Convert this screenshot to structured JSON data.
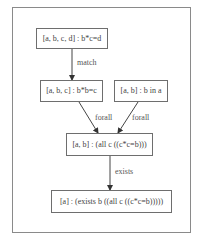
{
  "diagram": {
    "nodes": [
      {
        "id": "n1",
        "label": "[a, b, c, d] : b*c=d"
      },
      {
        "id": "n2",
        "label": "[a, b, c] : b*b=c"
      },
      {
        "id": "n3",
        "label": "[a, b] : b in a"
      },
      {
        "id": "n4",
        "label": "[a, b] : (all c ((c*c=b)))"
      },
      {
        "id": "n5",
        "label": "[a] : (exists b ((all c ((c*c=b)))))"
      }
    ],
    "edges": [
      {
        "from": "n1",
        "to": "n2",
        "label": "match"
      },
      {
        "from": "n2",
        "to": "n4",
        "label": "forall"
      },
      {
        "from": "n3",
        "to": "n4",
        "label": "forall"
      },
      {
        "from": "n4",
        "to": "n5",
        "label": "exists"
      }
    ]
  }
}
